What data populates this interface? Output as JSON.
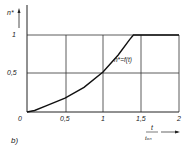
{
  "panel_label": "b)",
  "chart_data": {
    "type": "line",
    "title": "",
    "xlabel": "t / t_on",
    "xlabel_num": "t",
    "xlabel_den": "tₒₙ",
    "ylabel": "n*",
    "xlim": [
      0,
      2
    ],
    "ylim": [
      0,
      1.1
    ],
    "grid": true,
    "x_ticks": [
      "0",
      "0,5",
      "1",
      "1,5",
      "2"
    ],
    "y_ticks": [
      "0,5",
      "1"
    ],
    "annotation": "n*=f(t)",
    "series": [
      {
        "name": "n*=f(t)",
        "x": [
          0,
          0.1,
          0.25,
          0.5,
          0.75,
          1.0,
          1.2,
          1.35,
          1.4,
          1.6,
          1.8,
          2.0
        ],
        "values": [
          0,
          0.02,
          0.08,
          0.18,
          0.32,
          0.52,
          0.74,
          0.94,
          1.0,
          1.0,
          1.0,
          1.0
        ]
      }
    ]
  }
}
